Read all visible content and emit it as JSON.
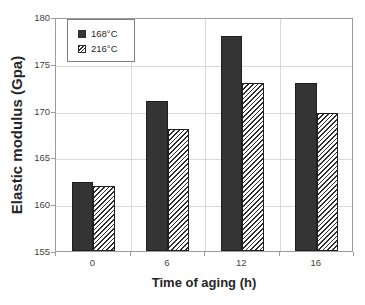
{
  "chart_data": {
    "type": "bar",
    "title": "",
    "xlabel": "Time of aging (h)",
    "ylabel": "Elastic modulus (Gpa)",
    "categories": [
      "0",
      "6",
      "12",
      "16"
    ],
    "series": [
      {
        "name": "168°C",
        "values": [
          162.4,
          171,
          178,
          173
        ],
        "style": "solid",
        "color": "#343434"
      },
      {
        "name": "216°C",
        "values": [
          161.9,
          168,
          173,
          169.7
        ],
        "style": "hatched",
        "color": "#2e2e2e"
      }
    ],
    "ylim": [
      155,
      180
    ],
    "yticks": [
      155,
      160,
      165,
      170,
      175,
      180
    ],
    "grid": true,
    "legend_position": "top-left-inside"
  },
  "colors": {
    "bar_solid": "#343434",
    "hatch_stripe": "#2e2e2e",
    "grid": "#d9d9d9",
    "plot_border": "#9b9b9b",
    "text": "#3f3f3f",
    "background": "#ffffff"
  }
}
